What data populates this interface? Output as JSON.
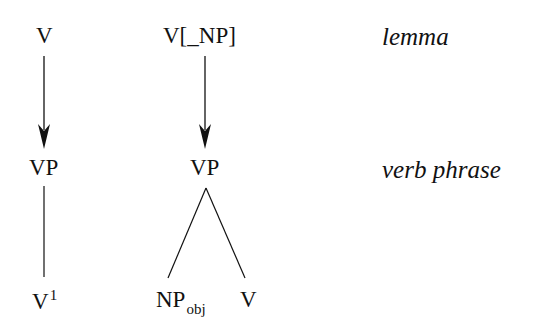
{
  "diagram": {
    "type": "derivation-tree",
    "columns": [
      {
        "id": "intransitive",
        "top": {
          "text": "V"
        },
        "middle": {
          "text": "VP"
        },
        "bottom": [
          {
            "text": "V",
            "superscript": "1"
          }
        ],
        "top_to_middle_edge": "arrow",
        "middle_to_bottom_edge": "line"
      },
      {
        "id": "transitive",
        "top": {
          "text": "V[_NP]"
        },
        "middle": {
          "text": "VP"
        },
        "bottom": [
          {
            "text": "NP",
            "subscript": "obj"
          },
          {
            "text": "V"
          }
        ],
        "top_to_middle_edge": "arrow",
        "middle_to_bottom_edge": "branching"
      }
    ],
    "row_labels": {
      "top": "lemma",
      "middle": "verb phrase"
    }
  }
}
